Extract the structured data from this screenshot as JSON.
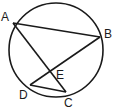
{
  "diagram": {
    "type": "circle-geometry",
    "circle": {
      "cx": 56,
      "cy": 50,
      "r": 47
    },
    "points": {
      "A": {
        "label": "A",
        "x": 13,
        "y": 23
      },
      "B": {
        "label": "B",
        "x": 100,
        "y": 37
      },
      "C": {
        "label": "C",
        "x": 66,
        "y": 92
      },
      "D": {
        "label": "D",
        "x": 30,
        "y": 85
      },
      "E": {
        "label": "E",
        "x": 50,
        "y": 72
      }
    },
    "segments": [
      "AB",
      "AC",
      "BD",
      "DC"
    ],
    "stroke_color": "#1a1a1a"
  }
}
